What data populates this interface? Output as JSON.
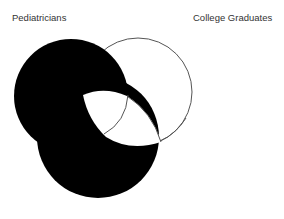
{
  "diagram": {
    "type": "venn",
    "labels": {
      "set_a": "Pediatricians",
      "set_b": "College Graduates"
    },
    "colors": {
      "shaded": "#000000",
      "unshaded": "#ffffff",
      "outline": "#555555",
      "label_text": "#333333"
    }
  }
}
